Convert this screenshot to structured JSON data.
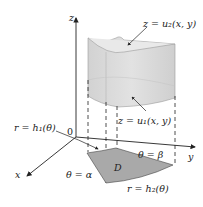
{
  "figure": {
    "axes": {
      "x": "x",
      "y": "y",
      "z": "z",
      "origin": "0"
    },
    "labels": {
      "top_surface": "z = u₂(x, y)",
      "bottom_surface": "z = u₁(x, y)",
      "inner_radius": "r = h₁(θ)",
      "outer_radius": "r = h₂(θ)",
      "angle_alpha": "θ = α",
      "angle_beta": "θ = β",
      "region": "D"
    },
    "colors": {
      "solid_fill": "#d9d9d9",
      "solid_top": "#e4e4e4",
      "region_fill": "#a9a9a9",
      "axis": "#222222"
    }
  }
}
